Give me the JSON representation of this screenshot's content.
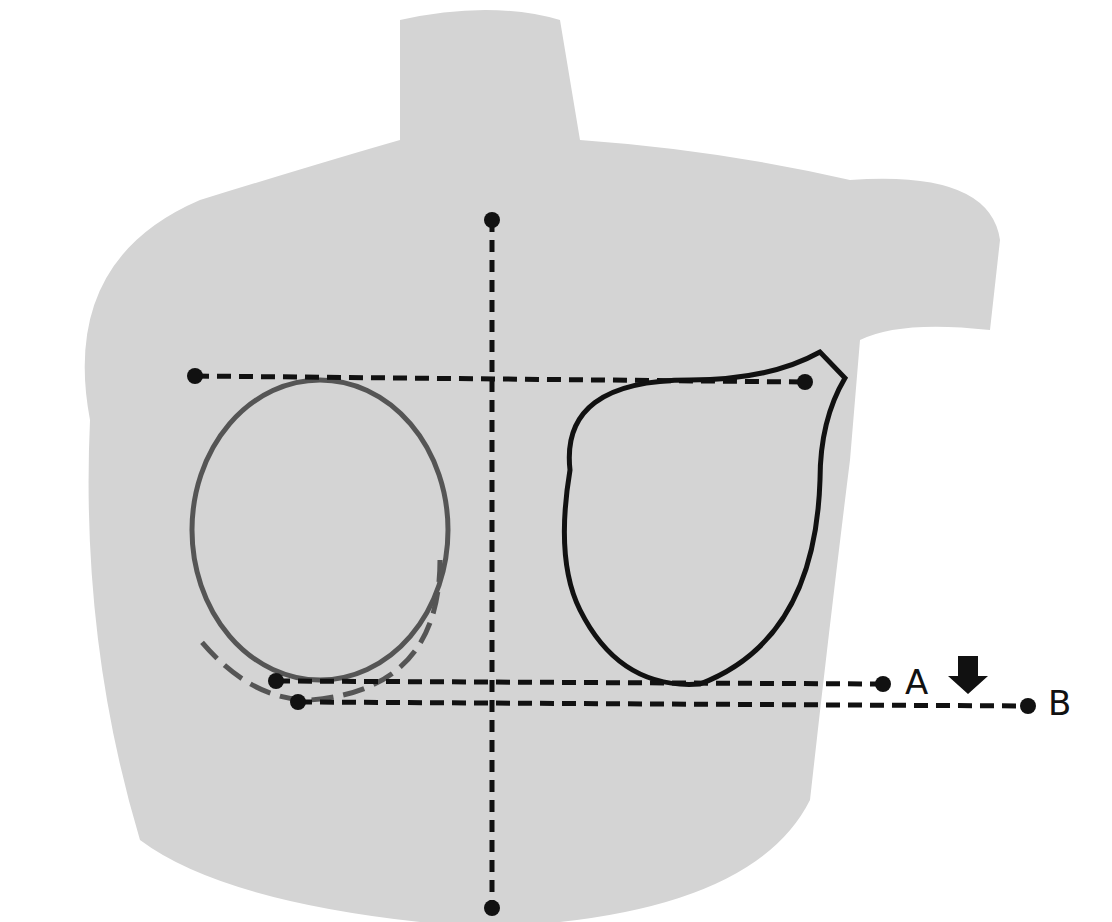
{
  "diagram": {
    "type": "anatomical-measurement-illustration",
    "labels": {
      "a": "A",
      "b": "B"
    },
    "colors": {
      "background": "#ffffff",
      "silhouette": "#c9c9c9",
      "line": "#111111",
      "outline_left": "#555555"
    },
    "lines": [
      {
        "name": "vertical-midline",
        "from": [
          492,
          220
        ],
        "to": [
          492,
          908
        ]
      },
      {
        "name": "upper-horizontal",
        "from": [
          195,
          376
        ],
        "to": [
          805,
          382
        ]
      },
      {
        "name": "line-a",
        "from": [
          276,
          681
        ],
        "to": [
          883,
          684
        ]
      },
      {
        "name": "line-b",
        "from": [
          298,
          702
        ],
        "to": [
          1028,
          706
        ]
      }
    ],
    "arrow": {
      "direction": "down",
      "position": [
        968,
        678
      ]
    }
  }
}
